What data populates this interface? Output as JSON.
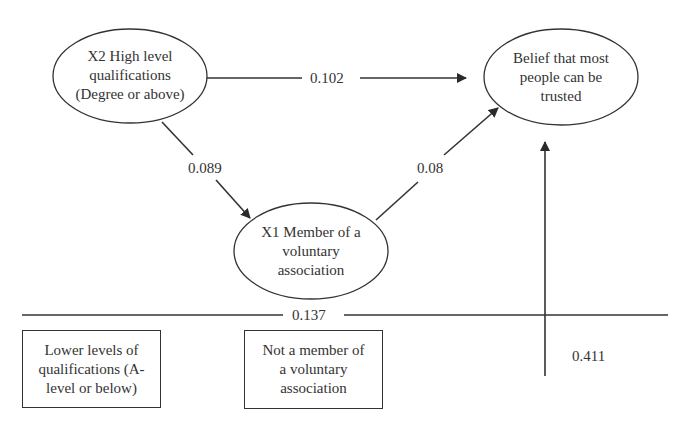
{
  "nodes": {
    "x2": {
      "label": "X2 High level qualifications (Degree or above)",
      "lines": [
        "X2 High level",
        "qualifications",
        "(Degree or above)"
      ]
    },
    "belief": {
      "label": "Belief that most people can be trusted",
      "lines": [
        "Belief that most",
        "people can be",
        "trusted"
      ]
    },
    "x1": {
      "label": "X1 Member of a voluntary association",
      "lines": [
        "X1 Member of a",
        "voluntary",
        "association"
      ]
    }
  },
  "reference_boxes": {
    "lower_quals": {
      "lines": [
        "Lower levels of",
        "qualifications (A-",
        "level or below)"
      ]
    },
    "not_member": {
      "lines": [
        "Not a member of",
        "a voluntary",
        "association"
      ]
    }
  },
  "paths": {
    "x2_to_belief": "0.102",
    "x2_to_x1": "0.089",
    "x1_to_belief": "0.08",
    "baseline": "0.137",
    "constant_to_belief": "0.411"
  },
  "colors": {
    "stroke": "#333333",
    "text": "#333333",
    "background": "#ffffff"
  }
}
